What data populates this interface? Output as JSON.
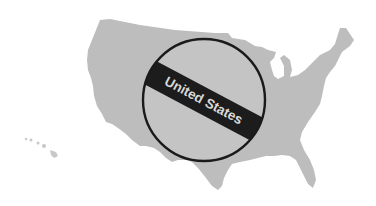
{
  "graphic": {
    "label": "United States",
    "colors": {
      "map_fill": "#bdbdbd",
      "circle_fill": "#c4c4c4",
      "circle_stroke": "#1a1a1a",
      "band_fill": "#1c1c1c",
      "label_fill": "#d8d8d8",
      "background": "#ffffff"
    }
  }
}
